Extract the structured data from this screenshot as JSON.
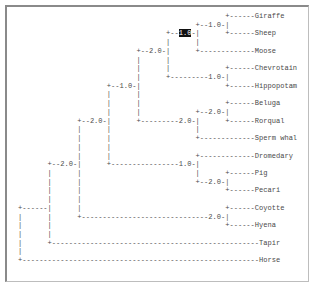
{
  "tree": {
    "taxa": [
      "Giraffe",
      "Sheep",
      "Moose",
      "Chevrotain",
      "Hippopotam",
      "Beluga",
      "Rorqual",
      "Sperm whal",
      "Dromedary",
      "Pig",
      "Pecari",
      "Coyotte",
      "Hyena",
      "Tapir",
      "Horse"
    ],
    "branch_labels": [
      "1.0",
      "1.0",
      "2.0",
      "1.0",
      "1.0",
      "2.0",
      "2.0",
      "2.0",
      "2.0",
      "1.0",
      "2.0",
      "2.0",
      "2.0"
    ],
    "highlighted_label": "1.0",
    "lines": [
      [
        {
          "t": "                                                 +------Giraffe"
        }
      ],
      [
        {
          "t": "                                          +--1.0-|"
        }
      ],
      [
        {
          "t": "                                   +--"
        },
        {
          "t": "1.0",
          "hl": true
        },
        {
          "t": "-|      +------Sheep"
        }
      ],
      [
        {
          "t": "                                   |      |"
        }
      ],
      [
        {
          "t": "                            +--2.0-|      +-------------Moose"
        }
      ],
      [
        {
          "t": "                            |      |"
        }
      ],
      [
        {
          "t": "                            |      |             +------Chevrotain"
        }
      ],
      [
        {
          "t": "                            |      +---------1.0-|"
        }
      ],
      [
        {
          "t": "                     +--1.0-|                    +------Hippopotam"
        }
      ],
      [
        {
          "t": "                     |      |"
        }
      ],
      [
        {
          "t": "                     |      |                    +------Beluga"
        }
      ],
      [
        {
          "t": "                     |      |             +--2.0-|"
        }
      ],
      [
        {
          "t": "              +--2.0-|      +---------2.0-|      +------Rorqual"
        }
      ],
      [
        {
          "t": "              |      |                    |"
        }
      ],
      [
        {
          "t": "              |      |                    +-------------Sperm whal"
        }
      ],
      [
        {
          "t": "              |      |"
        }
      ],
      [
        {
          "t": "              |      |                    +-------------Dromedary"
        }
      ],
      [
        {
          "t": "       +--2.0-|      +----------------1.0-|"
        }
      ],
      [
        {
          "t": "       |      |                           |      +------Pig"
        }
      ],
      [
        {
          "t": "       |      |                           +--2.0-|"
        }
      ],
      [
        {
          "t": "       |      |                                  +------Pecari"
        }
      ],
      [
        {
          "t": "       |      |"
        }
      ],
      [
        {
          "t": "+------|      |                                  +------Coyotte"
        }
      ],
      [
        {
          "t": "|      |      +------------------------------2.0-|"
        }
      ],
      [
        {
          "t": "|      |                                         +------Hyena"
        }
      ],
      [
        {
          "t": "|      |"
        }
      ],
      [
        {
          "t": "|      +-------------------------------------------------Tapir"
        }
      ],
      [
        {
          "t": "|"
        }
      ],
      [
        {
          "t": "+--------------------------------------------------------Horse"
        }
      ]
    ]
  },
  "colors": {
    "text": "#4a4a4a",
    "highlight_bg": "#111111",
    "highlight_fg": "#ffffff",
    "frame": "#8a8a8a"
  }
}
